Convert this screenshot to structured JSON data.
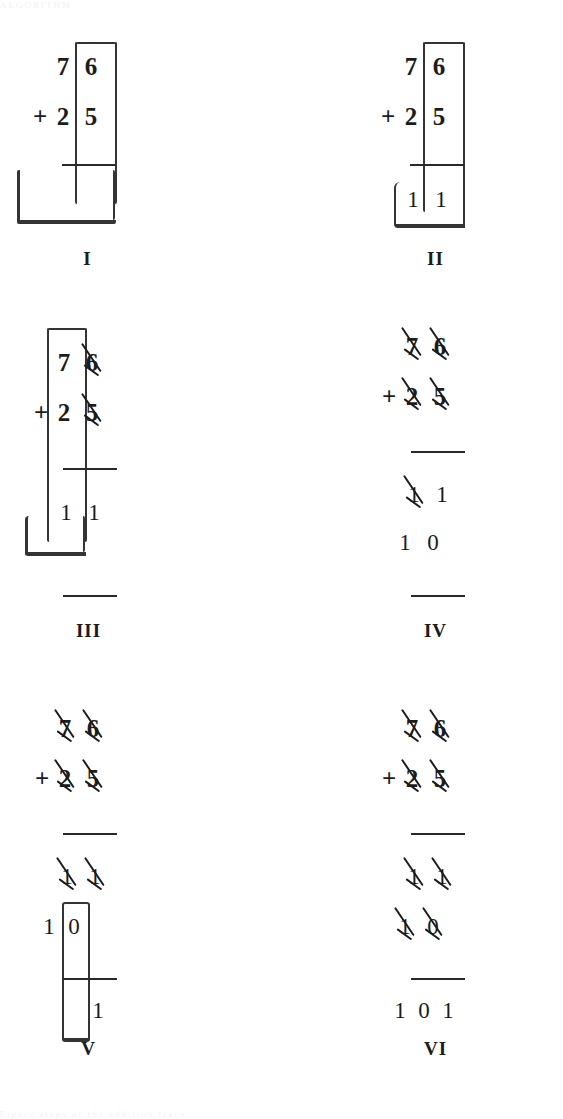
{
  "figure": {
    "ink_color": "#1c1c1c",
    "background": "#ffffff",
    "cropped_top_text": "ALGORITHM",
    "cropped_bottom_text": "Figure steps of the addition trace"
  },
  "problem": {
    "addend_top": "76",
    "addend_bottom": "25",
    "operator": "+",
    "sum": "101"
  },
  "panels": [
    {
      "id": "I",
      "label": "I",
      "rows": [
        {
          "name": "addend-top",
          "digits": [
            "7",
            "6"
          ],
          "operator": "",
          "struck": [
            false,
            false
          ]
        },
        {
          "name": "addend-bottom",
          "digits": [
            "2",
            "5"
          ],
          "operator": "+",
          "struck": [
            false,
            false
          ]
        }
      ],
      "rule": true,
      "result_rows": [],
      "annotation": "ones-column-and-carry-region"
    },
    {
      "id": "II",
      "label": "II",
      "rows": [
        {
          "name": "addend-top",
          "digits": [
            "7",
            "6"
          ],
          "operator": "",
          "struck": [
            false,
            false
          ]
        },
        {
          "name": "addend-bottom",
          "digits": [
            "2",
            "5"
          ],
          "operator": "+",
          "struck": [
            false,
            false
          ]
        }
      ],
      "rule": true,
      "result_rows": [
        {
          "name": "partial-sum-1",
          "digits": [
            "1",
            "1"
          ],
          "struck": [
            false,
            false
          ]
        }
      ],
      "annotation": "ones-column-with-partial-sum-region"
    },
    {
      "id": "III",
      "label": "III",
      "rows": [
        {
          "name": "addend-top",
          "digits": [
            "7",
            "6"
          ],
          "operator": "",
          "struck": [
            false,
            true
          ]
        },
        {
          "name": "addend-bottom",
          "digits": [
            "2",
            "5"
          ],
          "operator": "+",
          "struck": [
            false,
            true
          ]
        }
      ],
      "rule": true,
      "result_rows": [
        {
          "name": "partial-sum-1",
          "digits": [
            "1",
            "1"
          ],
          "struck": [
            false,
            false
          ]
        }
      ],
      "bottom_rule": true,
      "annotation": "tens-column-and-carry-region"
    },
    {
      "id": "IV",
      "label": "IV",
      "rows": [
        {
          "name": "addend-top",
          "digits": [
            "7",
            "6"
          ],
          "operator": "",
          "struck": [
            true,
            true
          ]
        },
        {
          "name": "addend-bottom",
          "digits": [
            "2",
            "5"
          ],
          "operator": "+",
          "struck": [
            true,
            true
          ]
        }
      ],
      "rule": true,
      "result_rows": [
        {
          "name": "partial-sum-1",
          "digits": [
            "1",
            "1"
          ],
          "struck": [
            true,
            false
          ]
        },
        {
          "name": "partial-sum-2",
          "digits": [
            "1",
            "0"
          ],
          "struck": [
            false,
            false
          ]
        }
      ],
      "bottom_rule": true,
      "annotation": "no-region"
    },
    {
      "id": "V",
      "label": "V",
      "rows": [
        {
          "name": "addend-top",
          "digits": [
            "7",
            "6"
          ],
          "operator": "",
          "struck": [
            true,
            true
          ]
        },
        {
          "name": "addend-bottom",
          "digits": [
            "2",
            "5"
          ],
          "operator": "+",
          "struck": [
            true,
            true
          ]
        }
      ],
      "rule": true,
      "result_rows": [
        {
          "name": "partial-sum-1",
          "digits": [
            "1",
            "1"
          ],
          "struck": [
            true,
            true
          ]
        },
        {
          "name": "partial-sum-2",
          "digits": [
            "1",
            "0"
          ],
          "struck": [
            false,
            false
          ]
        }
      ],
      "final_digits": [
        "1"
      ],
      "annotation": "zero-column-region"
    },
    {
      "id": "VI",
      "label": "VI",
      "rows": [
        {
          "name": "addend-top",
          "digits": [
            "7",
            "6"
          ],
          "operator": "",
          "struck": [
            true,
            true
          ]
        },
        {
          "name": "addend-bottom",
          "digits": [
            "2",
            "5"
          ],
          "operator": "+",
          "struck": [
            true,
            true
          ]
        }
      ],
      "rule": true,
      "result_rows": [
        {
          "name": "partial-sum-1",
          "digits": [
            "1",
            "1"
          ],
          "struck": [
            true,
            true
          ]
        },
        {
          "name": "partial-sum-2",
          "digits": [
            "1",
            "0"
          ],
          "struck": [
            true,
            true
          ]
        }
      ],
      "bottom_rule": true,
      "final_digits": [
        "1",
        "0",
        "1"
      ],
      "annotation": "no-region"
    }
  ]
}
